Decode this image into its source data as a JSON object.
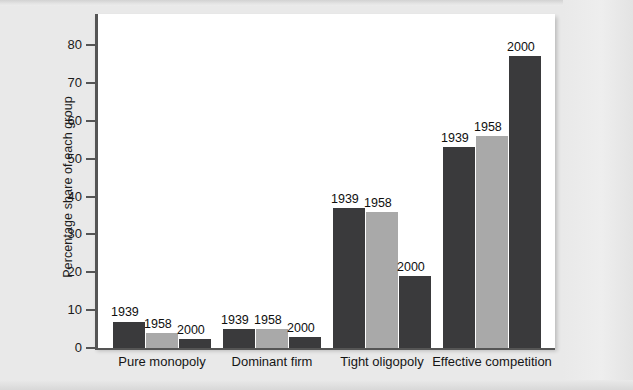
{
  "chart_data": {
    "type": "bar",
    "title": "",
    "xlabel": "",
    "ylabel": "Percentage share of each group",
    "ylim": [
      0,
      85
    ],
    "yticks": [
      0,
      10,
      20,
      30,
      40,
      50,
      60,
      70,
      80
    ],
    "ytick_labels": [
      "0",
      "10",
      "20",
      "30",
      "40",
      "50",
      "60",
      "70",
      "80"
    ],
    "grid": false,
    "legend": "none",
    "legend_position": "above-bars",
    "categories": [
      "Pure monopoly",
      "Dominant firm",
      "Tight oligopoly",
      "Effective competition"
    ],
    "series": [
      {
        "name": "1939",
        "color": "#3a3a3c",
        "values": [
          7,
          5,
          37,
          53
        ]
      },
      {
        "name": "1958",
        "color": "#a9a9a9",
        "values": [
          4,
          5,
          36,
          56
        ]
      },
      {
        "name": "2000",
        "color": "#3a3a3c",
        "values": [
          2.5,
          3,
          19,
          77
        ]
      }
    ],
    "bar_value_labels": [
      [
        "1939",
        "1958",
        "2000"
      ],
      [
        "1939",
        "1958",
        "2000"
      ],
      [
        "1939",
        "1958",
        "2000"
      ],
      [
        "1939",
        "1958",
        "2000"
      ]
    ]
  },
  "colors": {
    "dark_bar": "#3a3a3c",
    "light_bar": "#a9a9a9",
    "axis": "#555555",
    "plot_background": "#ffffff",
    "page_background": "#e9e9e9",
    "text": "#151515"
  }
}
